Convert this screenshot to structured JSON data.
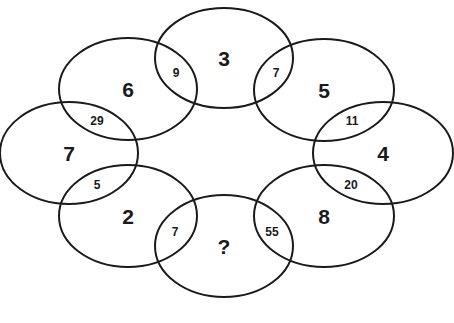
{
  "puzzle": {
    "ellipses": [
      {
        "id": "top",
        "label": "3",
        "cx": 224,
        "cy": 58,
        "rx": 69,
        "ry": 50
      },
      {
        "id": "upper-right",
        "label": "5",
        "cx": 324,
        "cy": 90,
        "rx": 70,
        "ry": 51
      },
      {
        "id": "right",
        "label": "4",
        "cx": 383,
        "cy": 153,
        "rx": 70,
        "ry": 51
      },
      {
        "id": "lower-right",
        "label": "8",
        "cx": 324,
        "cy": 216,
        "rx": 70,
        "ry": 51
      },
      {
        "id": "bottom",
        "label": "?",
        "cx": 224,
        "cy": 246,
        "rx": 69,
        "ry": 51
      },
      {
        "id": "lower-left",
        "label": "2",
        "cx": 128,
        "cy": 216,
        "rx": 69,
        "ry": 51
      },
      {
        "id": "left",
        "label": "7",
        "cx": 69,
        "cy": 153,
        "rx": 69,
        "ry": 51
      },
      {
        "id": "upper-left",
        "label": "6",
        "cx": 128,
        "cy": 89,
        "rx": 69,
        "ry": 51
      }
    ],
    "intersections": [
      {
        "between": [
          "6",
          "3"
        ],
        "value": "9",
        "x": 176,
        "y": 73
      },
      {
        "between": [
          "3",
          "5"
        ],
        "value": "7",
        "x": 276,
        "y": 73
      },
      {
        "between": [
          "5",
          "4"
        ],
        "value": "11",
        "x": 352,
        "y": 121
      },
      {
        "between": [
          "4",
          "8"
        ],
        "value": "20",
        "x": 351,
        "y": 185
      },
      {
        "between": [
          "8",
          "?"
        ],
        "value": "55",
        "x": 272,
        "y": 232
      },
      {
        "between": [
          "?",
          "2"
        ],
        "value": "7",
        "x": 175,
        "y": 232
      },
      {
        "between": [
          "2",
          "7"
        ],
        "value": "5",
        "x": 97,
        "y": 185
      },
      {
        "between": [
          "7",
          "6"
        ],
        "value": "29",
        "x": 97,
        "y": 121
      }
    ]
  }
}
